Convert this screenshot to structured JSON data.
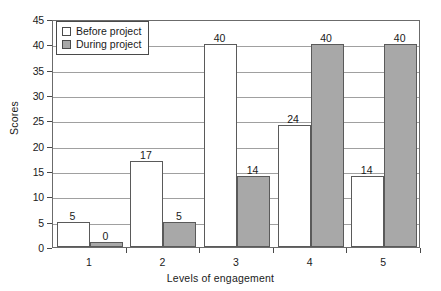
{
  "chart_data": {
    "type": "bar",
    "title": "",
    "xlabel": "Levels of engagement",
    "ylabel": "Scores",
    "categories": [
      "1",
      "2",
      "3",
      "4",
      "5"
    ],
    "series": [
      {
        "name": "Before project",
        "values": [
          5,
          17,
          40,
          24,
          14
        ],
        "color": "#ffffff"
      },
      {
        "name": "During project",
        "values": [
          0,
          5,
          14,
          40,
          40
        ],
        "color": "#a8a8a8"
      }
    ],
    "ylim": [
      0,
      45
    ],
    "ytick_step": 5,
    "yticks": [
      "0",
      "5",
      "10",
      "15",
      "20",
      "25",
      "30",
      "35",
      "40",
      "45"
    ],
    "grid": "horizontal",
    "legend_position": "top-left",
    "data_labels": [
      [
        "5",
        "17",
        "40",
        "24",
        "14"
      ],
      [
        "0",
        "5",
        "14",
        "40",
        "40"
      ]
    ]
  },
  "axis": {
    "y_title": "Scores",
    "x_title": "Levels of engagement"
  },
  "legend": {
    "items": [
      {
        "label": "Before project",
        "swatch": "legend-swatch-before"
      },
      {
        "label": "During project",
        "swatch": "legend-swatch-during"
      }
    ]
  }
}
